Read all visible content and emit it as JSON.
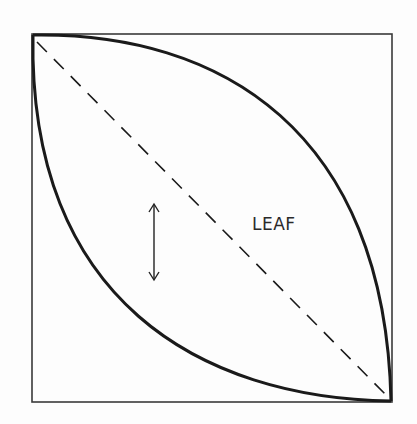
{
  "diagram": {
    "label": "LEAF",
    "shape": "leaf (vesica) formed by two arcs inscribed in a square",
    "elements": [
      "square-frame",
      "upper-arc",
      "lower-arc",
      "dashed-diagonal",
      "double-headed-arrow"
    ],
    "colors": {
      "stroke": "#1a1a1a",
      "frame": "#3a3a3a",
      "background": "#fdfdfd"
    }
  }
}
